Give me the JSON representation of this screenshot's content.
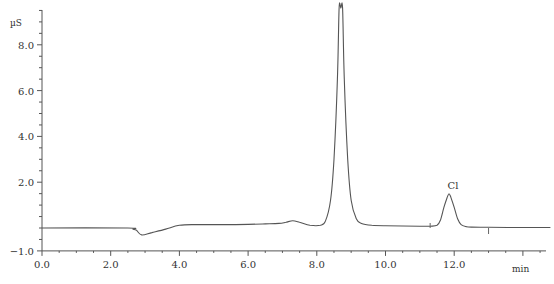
{
  "chart_data": {
    "type": "line",
    "title": "",
    "xlabel": "min",
    "ylabel": "µS",
    "xlim": [
      0.0,
      14.8
    ],
    "ylim": [
      -1.0,
      9.6
    ],
    "grid": false,
    "legend": null,
    "x_ticks": [
      0.0,
      2.0,
      4.0,
      6.0,
      8.0,
      10.0,
      12.0
    ],
    "x_tick_labels": [
      "0.0",
      "2.0",
      "4.0",
      "6.0",
      "8.0",
      "10.0",
      "12.0"
    ],
    "y_ticks": [
      -1.0,
      2.0,
      4.0,
      6.0,
      8.0
    ],
    "y_tick_labels": [
      "-1.0",
      "2.0",
      "4.0",
      "6.0",
      "8.0"
    ],
    "series": [
      {
        "name": "Conductivity signal",
        "color": "#555555",
        "x": [
          0.0,
          2.5,
          2.65,
          2.75,
          2.9,
          3.2,
          3.6,
          4.0,
          4.5,
          5.5,
          6.5,
          6.9,
          7.1,
          7.3,
          7.5,
          7.8,
          8.1,
          8.25,
          8.4,
          8.5,
          8.6,
          8.65,
          8.7,
          8.75,
          8.8,
          8.9,
          9.0,
          9.15,
          9.3,
          9.6,
          10.0,
          11.0,
          11.3,
          11.5,
          11.6,
          11.7,
          11.8,
          11.85,
          11.9,
          12.0,
          12.1,
          12.2,
          12.35,
          12.5,
          13.0,
          14.0,
          14.8
        ],
        "values": [
          0.0,
          0.0,
          -0.05,
          -0.1,
          -0.3,
          -0.2,
          -0.05,
          0.12,
          0.15,
          0.15,
          0.18,
          0.2,
          0.25,
          0.32,
          0.25,
          0.12,
          0.12,
          0.3,
          1.2,
          3.0,
          6.5,
          9.6,
          9.6,
          9.6,
          6.5,
          3.0,
          1.2,
          0.4,
          0.2,
          0.12,
          0.1,
          0.08,
          0.08,
          0.12,
          0.35,
          0.9,
          1.35,
          1.5,
          1.35,
          0.9,
          0.4,
          0.15,
          0.06,
          0.04,
          0.03,
          0.02,
          0.02
        ]
      }
    ],
    "annotations": [
      {
        "text": "Cl",
        "x": 11.85,
        "y": 1.5,
        "type": "peak-label"
      },
      {
        "text": "integration start",
        "x": 11.3,
        "type": "marker"
      },
      {
        "text": "integration end",
        "x": 13.0,
        "type": "marker"
      }
    ],
    "peaks": [
      {
        "name": "",
        "retention_time": 8.7,
        "height": "off-scale (>9.5)"
      },
      {
        "name": "Cl",
        "retention_time": 11.85,
        "height": 1.5
      }
    ]
  },
  "axes": {
    "y_unit": "µS",
    "x_unit": "min"
  }
}
